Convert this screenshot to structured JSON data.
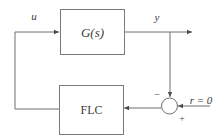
{
  "diagram": {
    "type": "feedback-control-block-diagram",
    "blocks": [
      {
        "id": "plant",
        "label": "G(s)"
      },
      {
        "id": "controller",
        "label": "FLC"
      }
    ],
    "summing_junction": {
      "minus_sign": "−",
      "plus_sign": "+"
    },
    "signals": {
      "control_input": "u",
      "output": "y",
      "reference": "r = 0"
    },
    "colors": {
      "line": "#6e6e6e",
      "text": "#3a3a3a",
      "background": "#ffffff"
    }
  }
}
